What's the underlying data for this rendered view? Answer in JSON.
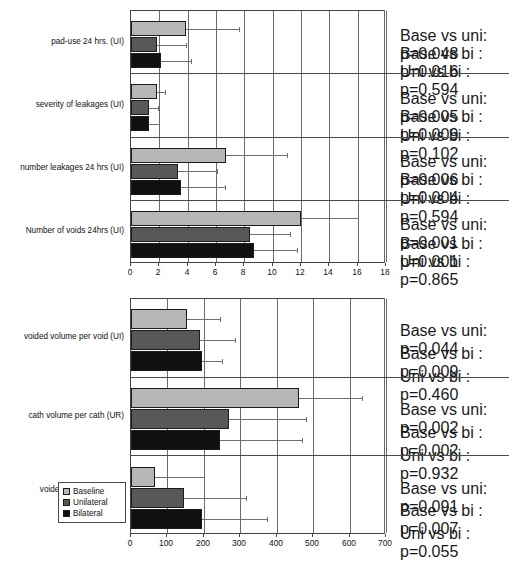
{
  "chart_data": [
    {
      "type": "bar",
      "orientation": "horizontal",
      "title": "",
      "xlabel": "",
      "ylabel": "",
      "xlim": [
        0,
        18
      ],
      "xticks": [
        0,
        2,
        4,
        6,
        8,
        10,
        12,
        14,
        16,
        18
      ],
      "grid": true,
      "legend": [
        "Baseline",
        "Unilateral",
        "Bilateral"
      ],
      "legend_position": "none",
      "categories": [
        "pad-use 24 hrs. (UI)",
        "severity of leakages (UI)",
        "number leakages 24 hrs (UI)",
        "Number of voids 24hrs (UI)"
      ],
      "series": [
        {
          "name": "Baseline",
          "color": "#b6b6b6",
          "values": [
            3.9,
            1.8,
            6.7,
            12.0
          ],
          "errors_upper": [
            7.6,
            2.4,
            11.0,
            16.0
          ]
        },
        {
          "name": "Unilateral",
          "color": "#585858",
          "values": [
            1.8,
            1.25,
            3.3,
            8.4
          ],
          "errors_upper": [
            3.9,
            1.9,
            6.1,
            11.2
          ]
        },
        {
          "name": "Bilateral",
          "color": "#101010",
          "values": [
            2.1,
            1.3,
            3.5,
            8.7
          ],
          "errors_upper": [
            4.2,
            2.0,
            6.6,
            11.7
          ]
        }
      ],
      "annotations": [
        [
          "Base vs uni: p=0.048",
          "Base vs bi :  p=0.016",
          "Uni vs bi :    p=0.594"
        ],
        [
          "Base vs uni: p=0.005",
          "Base vs bi :  p=0.009",
          "Uni vs bi :    p=0.102"
        ],
        [
          "Base vs uni: p=0.006",
          "Base vs bi :  p=0.004",
          "Uni vs bi :    p=0.594"
        ],
        [
          "Base vs uni: p=0.001",
          "Base vs bi :  p=0.001",
          "Uni vs bi :    p=0.865"
        ]
      ]
    },
    {
      "type": "bar",
      "orientation": "horizontal",
      "title": "",
      "xlabel": "",
      "ylabel": "",
      "xlim": [
        0,
        700
      ],
      "xticks": [
        0,
        100,
        200,
        300,
        400,
        500,
        600,
        700
      ],
      "grid": true,
      "legend": [
        "Baseline",
        "Unilateral",
        "Bilateral"
      ],
      "legend_position": "lower-left",
      "categories": [
        "voided volume per void (UI)",
        "cath volume per cath (UR)",
        "voided volume per void\n(UR)"
      ],
      "series": [
        {
          "name": "Baseline",
          "color": "#b6b6b6",
          "values": [
            155,
            460,
            65
          ],
          "errors_upper": [
            245,
            635,
            200
          ]
        },
        {
          "name": "Unilateral",
          "color": "#585858",
          "values": [
            190,
            270,
            145
          ],
          "errors_upper": [
            285,
            480,
            315
          ]
        },
        {
          "name": "Bilateral",
          "color": "#101010",
          "values": [
            195,
            245,
            195
          ],
          "errors_upper": [
            250,
            470,
            372
          ]
        }
      ],
      "annotations": [
        [
          "Base vs uni: p=0.044",
          "Base vs bi :  p=0.009",
          "Uni vs bi :    p=0.460"
        ],
        [
          "Base vs uni: p=0.002",
          "Base vs bi :  p=0.002",
          "Uni vs bi :    p=0.932"
        ],
        [
          "Base vs uni: p=0.091",
          "Base vs bi :  p=0.007",
          "Uni vs bi :    p=0.055"
        ]
      ]
    }
  ],
  "colors": {
    "baseline": "#b6b6b6",
    "unilateral": "#585858",
    "bilateral": "#101010",
    "axis": "#444444",
    "grid": "#6b6b6b"
  },
  "legend": {
    "items": [
      {
        "label": "Baseline",
        "key": "baseline"
      },
      {
        "label": "Unilateral",
        "key": "unilateral"
      },
      {
        "label": "Bilateral",
        "key": "bilateral"
      }
    ]
  }
}
